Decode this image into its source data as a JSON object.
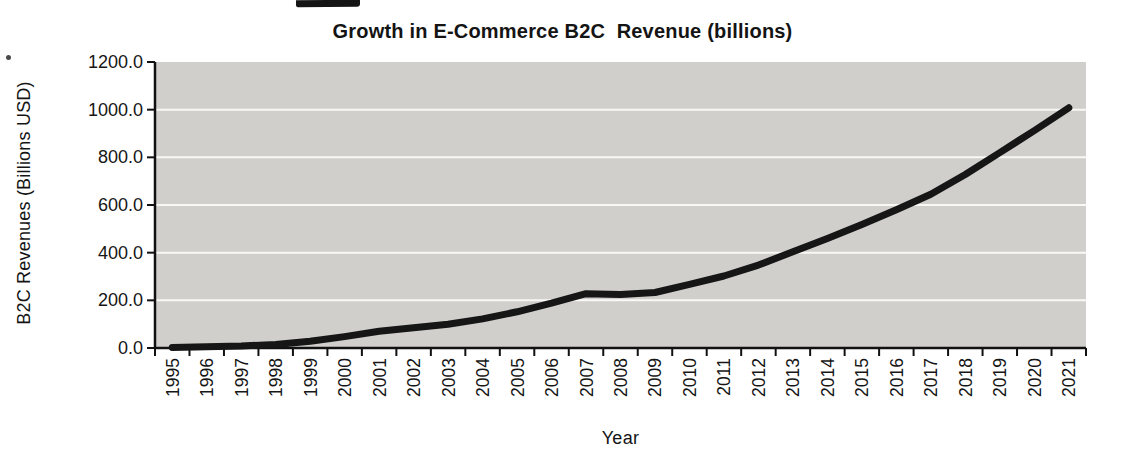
{
  "chart_data": {
    "type": "line",
    "title": "Growth in E-Commerce B2C  Revenue (billions)",
    "xlabel": "Year",
    "ylabel": "B2C Revenues (Billions USD)",
    "x": [
      "1995",
      "1996",
      "1997",
      "1998",
      "1999",
      "2000",
      "2001",
      "2002",
      "2003",
      "2004",
      "2005",
      "2006",
      "2007",
      "2008",
      "2009",
      "2010",
      "2011",
      "2012",
      "2013",
      "2014",
      "2015",
      "2016",
      "2017",
      "2018",
      "2019",
      "2020",
      "2021"
    ],
    "series": [
      {
        "name": "B2C Revenue",
        "values": [
          2,
          5,
          8,
          15,
          28,
          48,
          70,
          85,
          100,
          122,
          152,
          188,
          228,
          224,
          233,
          267,
          302,
          348,
          404,
          460,
          518,
          580,
          645,
          728,
          820,
          912,
          1008
        ]
      }
    ],
    "ylim": [
      0,
      1200
    ],
    "ytick_step": 200,
    "ytick_labels": [
      "0.0",
      "200.0",
      "400.0",
      "600.0",
      "800.0",
      "1000.0",
      "1200.0"
    ],
    "grid": "horizontal",
    "legend": "none",
    "plot_bg_color": "#d0cfcc",
    "gridline_color": "#f8f8f5",
    "line_color": "#161616",
    "axis_color": "#111111"
  },
  "artifacts": {
    "top_ink_mark": "black scan smudge at top edge",
    "left_speck": "small scan speck near y-axis top"
  }
}
